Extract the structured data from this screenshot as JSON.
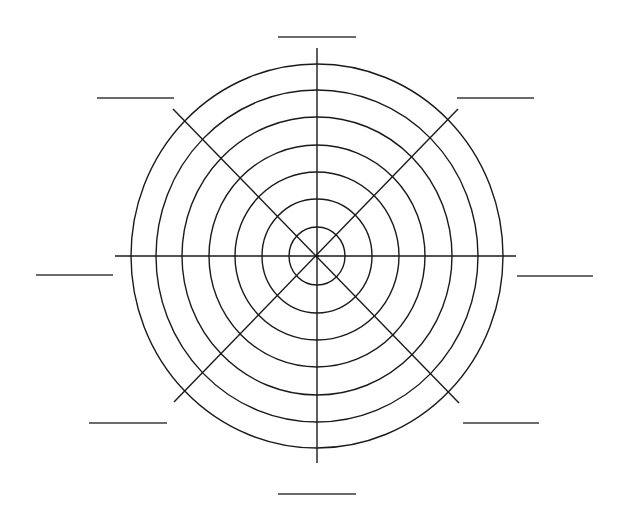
{
  "diagram": {
    "type": "polar-web-diagram",
    "center": {
      "x": 317,
      "y": 256
    },
    "ring_count": 7,
    "rings": [
      {
        "rx": 28,
        "ry": 29
      },
      {
        "rx": 55,
        "ry": 57
      },
      {
        "rx": 82,
        "ry": 84
      },
      {
        "rx": 108,
        "ry": 111
      },
      {
        "rx": 135,
        "ry": 139
      },
      {
        "rx": 161,
        "ry": 166
      },
      {
        "rx": 186,
        "ry": 192
      }
    ],
    "spokes": [
      {
        "name": "vertical",
        "x1": 317,
        "y1": 48,
        "x2": 317,
        "y2": 463
      },
      {
        "name": "horizontal",
        "x1": 115,
        "y1": 256,
        "x2": 516,
        "y2": 256
      },
      {
        "name": "diagonal-down",
        "x1": 173,
        "y1": 109,
        "x2": 459,
        "y2": 403
      },
      {
        "name": "diagonal-up",
        "x1": 458,
        "y1": 109,
        "x2": 174,
        "y2": 402
      }
    ],
    "label_blanks": [
      {
        "position": "top",
        "x1": 278,
        "x2": 356,
        "y": 37,
        "text": ""
      },
      {
        "position": "top-left",
        "x1": 97,
        "x2": 174,
        "y": 98,
        "text": ""
      },
      {
        "position": "top-right",
        "x1": 457,
        "x2": 534,
        "y": 98,
        "text": ""
      },
      {
        "position": "left",
        "x1": 36,
        "x2": 113,
        "y": 275,
        "text": ""
      },
      {
        "position": "right",
        "x1": 517,
        "x2": 593,
        "y": 276,
        "text": ""
      },
      {
        "position": "bottom-left",
        "x1": 89,
        "x2": 167,
        "y": 423,
        "text": ""
      },
      {
        "position": "bottom-right",
        "x1": 463,
        "x2": 539,
        "y": 423,
        "text": ""
      },
      {
        "position": "bottom",
        "x1": 278,
        "x2": 356,
        "y": 494,
        "text": ""
      }
    ],
    "colors": {
      "line": "#1a1a1a",
      "label_line": "#3a3a3a",
      "background": "#ffffff"
    }
  }
}
